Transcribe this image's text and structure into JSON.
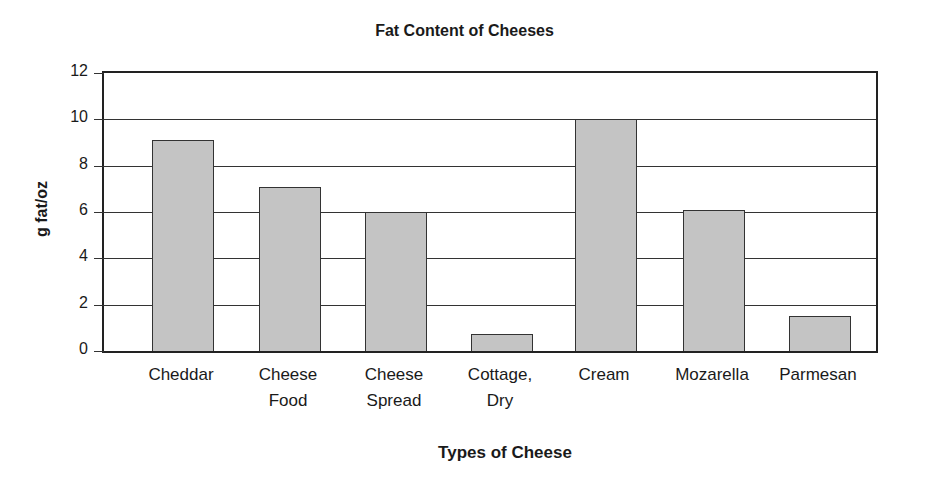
{
  "chart_data": {
    "type": "bar",
    "title": "Fat Content of Cheeses",
    "xlabel": "Types of Cheese",
    "ylabel": "g fat/oz",
    "ylim": [
      0,
      12
    ],
    "yticks": [
      "0",
      "2",
      "4",
      "6",
      "8",
      "10",
      "12"
    ],
    "grid": true,
    "legend": null,
    "categories": [
      "Cheddar",
      "Cheese Food",
      "Cheese Spread",
      "Cottage, Dry",
      "Cream",
      "Mozarella",
      "Parmesan"
    ],
    "category_labels": [
      "Cheddar",
      "Cheese\nFood",
      "Cheese\nSpread",
      "Cottage,\nDry",
      "Cream",
      "Mozarella",
      "Parmesan"
    ],
    "values": [
      9.1,
      7.1,
      6.0,
      0.75,
      10.0,
      6.1,
      1.5
    ]
  }
}
